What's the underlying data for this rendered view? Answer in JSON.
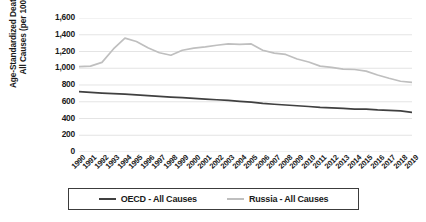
{
  "chart_data": {
    "type": "line",
    "title": "",
    "xlabel": "",
    "ylabel": "Age-Standardized Death Rates, All Causes (per 100,000)",
    "ylabel_lines": [
      "Age-Standardized Death Rates,",
      "All Causes  (per 100,000)"
    ],
    "ylim": [
      0,
      1600
    ],
    "ytick_step": 200,
    "yticks": [
      "0",
      "200",
      "400",
      "600",
      "800",
      "1,000",
      "1,200",
      "1,400",
      "1,600"
    ],
    "ytick_values": [
      0,
      200,
      400,
      600,
      800,
      1000,
      1200,
      1400,
      1600
    ],
    "grid": true,
    "grid_axis": "y",
    "legend_position": "bottom",
    "categories": [
      "1990",
      "1991",
      "1992",
      "1993",
      "1994",
      "1995",
      "1996",
      "1997",
      "1998",
      "1999",
      "2000",
      "2001",
      "2002",
      "2003",
      "2004",
      "2005",
      "2006",
      "2007",
      "2008",
      "2009",
      "2010",
      "2011",
      "2012",
      "2013",
      "2014",
      "2015",
      "2016",
      "2017",
      "2018",
      "2019"
    ],
    "series": [
      {
        "name": "OECD - All Causes",
        "color": "#404040",
        "values": [
          720,
          712,
          704,
          697,
          690,
          682,
          673,
          664,
          656,
          650,
          641,
          632,
          624,
          617,
          605,
          596,
          580,
          570,
          561,
          552,
          543,
          533,
          527,
          521,
          512,
          512,
          502,
          497,
          491,
          474
        ]
      },
      {
        "name": "Russia - All Causes",
        "color": "#BFBFBF",
        "values": [
          1020,
          1025,
          1070,
          1230,
          1360,
          1320,
          1245,
          1185,
          1155,
          1215,
          1240,
          1255,
          1275,
          1290,
          1285,
          1290,
          1215,
          1180,
          1165,
          1110,
          1075,
          1025,
          1010,
          990,
          985,
          965,
          920,
          880,
          845,
          832
        ]
      }
    ]
  },
  "legend": {
    "items": [
      {
        "label": "OECD - All Causes",
        "color": "#404040"
      },
      {
        "label": "Russia - All Causes",
        "color": "#BFBFBF"
      }
    ]
  },
  "colors": {
    "oecd_line": "#404040",
    "russia_line": "#BFBFBF",
    "gridline": "#D9D9D9",
    "text": "#1a1a1a",
    "background": "#ffffff"
  }
}
